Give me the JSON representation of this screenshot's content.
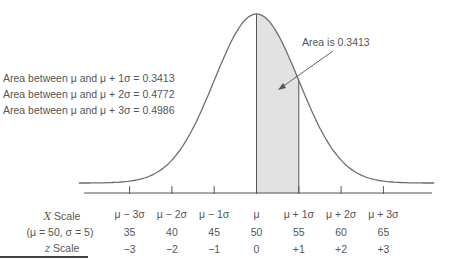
{
  "chart_data": {
    "type": "area",
    "title": "",
    "mu": 50,
    "sigma": 5,
    "curve": "normal distribution",
    "shaded_region": {
      "from_z": 0,
      "to_z": 1,
      "area": 0.3413,
      "fill": "#e2e2e2"
    },
    "annotations": {
      "area_lines": [
        {
          "prefix": "Area between ",
          "mu": "μ",
          "mid": " and ",
          "expr": "μ + 1σ",
          "eq": " = 0.3413"
        },
        {
          "prefix": "Area between ",
          "mu": "μ",
          "mid": " and ",
          "expr": "μ + 2σ",
          "eq": " = 0.4772"
        },
        {
          "prefix": "Area between ",
          "mu": "μ",
          "mid": " and ",
          "expr": "μ + 3σ",
          "eq": " = 0.4986"
        }
      ],
      "callout": "Area is 0.3413"
    },
    "axis_labels": {
      "x_scale": "X Scale",
      "params": "(μ = 50, σ = 5)",
      "z_scale": "z Scale"
    },
    "ticks": {
      "z": [
        -3,
        -2,
        -1,
        0,
        1,
        2,
        3
      ],
      "sigma_labels": [
        "μ − 3σ",
        "μ − 2σ",
        "μ − 1σ",
        "μ",
        "μ + 1σ",
        "μ + 2σ",
        "μ + 3σ"
      ],
      "x_values": [
        "35",
        "40",
        "45",
        "50",
        "55",
        "60",
        "65"
      ],
      "z_labels": [
        "−3",
        "−2",
        "−1",
        "0",
        "+1",
        "+2",
        "+3"
      ]
    },
    "colors": {
      "curve": "#6e6e6e",
      "axis": "#555555",
      "text": "#555555"
    }
  }
}
